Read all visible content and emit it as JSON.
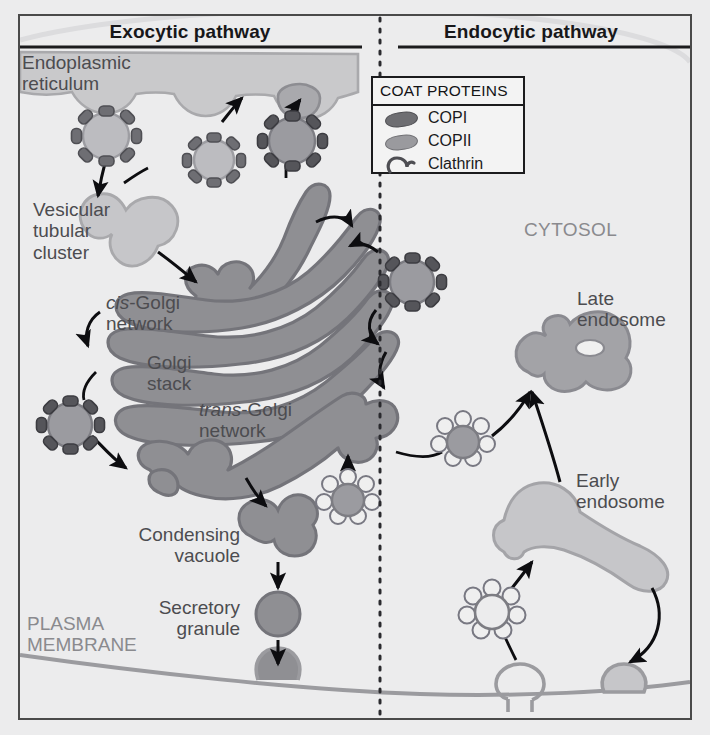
{
  "figure": {
    "background_color": "#ececed",
    "frame_color": "#4a4a4a"
  },
  "headers": {
    "exocytic": "Exocytic pathway",
    "endocytic": "Endocytic pathway",
    "divider": "vertical-dotted-line"
  },
  "legend": {
    "title": "COAT PROTEINS",
    "items": [
      {
        "label": "COPI",
        "icon": "copi-bean",
        "color": "#6e6e72"
      },
      {
        "label": "COPII",
        "icon": "copii-bean",
        "color": "#9a9a9e"
      },
      {
        "label": "Clathrin",
        "icon": "clathrin-hook",
        "color": "#5c5c60"
      }
    ]
  },
  "labels": {
    "er_line1": "Endoplasmic",
    "er_line2": "reticulum",
    "vtc_line1": "Vesicular",
    "vtc_line2": "tubular",
    "vtc_line3": "cluster",
    "cis_italic": "cis",
    "cis_rest": "-Golgi",
    "cis_line2": "network",
    "golgi_line1": "Golgi",
    "golgi_line2": "stack",
    "trans_italic": "trans",
    "trans_rest": "-Golgi",
    "trans_line2": "network",
    "condensing_line1": "Condensing",
    "condensing_line2": "vacuole",
    "secretory_line1": "Secretory",
    "secretory_line2": "granule",
    "plasma_line1": "PLASMA",
    "plasma_line2": "MEMBRANE",
    "cytosol": "CYTOSOL",
    "late_line1": "Late",
    "late_line2": "endosome",
    "early_line1": "Early",
    "early_line2": "endosome"
  },
  "colors": {
    "organelle_light": "#c9c9cb",
    "organelle_light_stroke": "#a9a9ac",
    "golgi_fill": "#8f8f93",
    "golgi_stroke": "#74747a",
    "vesicle_core_dark": "#8b8b90",
    "vesicle_core_light": "#b9b9bc",
    "coat_dark": "#55555a",
    "coat_mid": "#6e6e73",
    "clathrin_petal": "#efefef",
    "clathrin_stroke": "#777781",
    "late_endosome": "#a3a3a7",
    "early_endosome": "#c6c6c9",
    "membrane_stroke": "#9b9b9f",
    "arrow": "#0d0d10",
    "text": "#4c4c50",
    "text_gray": "#8a8a8e"
  },
  "structures": {
    "exocytic": [
      "endoplasmic-reticulum",
      "copii-vesicle-1",
      "copii-vesicle-2",
      "copi-vesicle-er",
      "vesicular-tubular-cluster",
      "cis-golgi-network",
      "golgi-stack",
      "trans-golgi-network",
      "copi-vesicle-retrograde-left",
      "copi-vesicle-retrograde-right",
      "condensing-vacuole",
      "secretory-granule",
      "exocytosis-fusion-vesicle"
    ],
    "endocytic": [
      "clathrin-vesicle-tgn",
      "clathrin-vesicle-to-endosome",
      "clathrin-vesicle-endocytic",
      "early-endosome",
      "late-endosome",
      "coated-pit",
      "plasma-membrane"
    ]
  }
}
